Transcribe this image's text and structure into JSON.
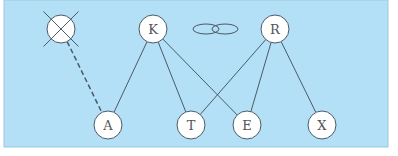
{
  "colors": {
    "background": "#b3e0f7",
    "node_fill": "#ffffff",
    "stroke": "#4a5a66",
    "panel_border": "#9cc7dc"
  },
  "nodes": [
    {
      "id": "crossed",
      "label": "",
      "x": 61,
      "y": 29,
      "r": 14,
      "crossed": true
    },
    {
      "id": "K",
      "label": "K",
      "x": 153,
      "y": 29,
      "r": 14
    },
    {
      "id": "R",
      "label": "R",
      "x": 275,
      "y": 29,
      "r": 14
    },
    {
      "id": "A",
      "label": "A",
      "x": 108,
      "y": 125,
      "r": 14
    },
    {
      "id": "T",
      "label": "T",
      "x": 191,
      "y": 125,
      "r": 14
    },
    {
      "id": "E",
      "label": "E",
      "x": 247,
      "y": 125,
      "r": 14
    },
    {
      "id": "X",
      "label": "X",
      "x": 322,
      "y": 125,
      "r": 14
    }
  ],
  "edges": [
    {
      "from": "K",
      "to": "A",
      "style": "solid"
    },
    {
      "from": "K",
      "to": "T",
      "style": "solid"
    },
    {
      "from": "K",
      "to": "E",
      "style": "solid"
    },
    {
      "from": "R",
      "to": "T",
      "style": "solid"
    },
    {
      "from": "R",
      "to": "E",
      "style": "solid"
    },
    {
      "from": "R",
      "to": "X",
      "style": "solid"
    },
    {
      "from": "crossed",
      "to": "A",
      "style": "dashed"
    }
  ],
  "link_symbol": {
    "ellipses": [
      {
        "cx": 206,
        "cy": 29,
        "rx": 13,
        "ry": 5
      },
      {
        "cx": 225,
        "cy": 29,
        "rx": 13,
        "ry": 5
      }
    ]
  }
}
